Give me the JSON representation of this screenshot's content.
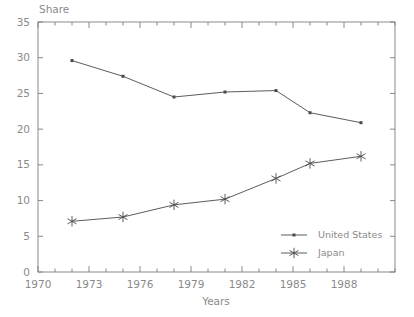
{
  "chart_data": {
    "type": "line",
    "title": "",
    "ylabel": "Share",
    "xlabel": "Years",
    "xlim": [
      1970,
      1991
    ],
    "ylim": [
      0,
      35
    ],
    "xticks": [
      1970,
      1973,
      1976,
      1979,
      1982,
      1985,
      1988
    ],
    "xtick_labels": [
      "1970",
      "1973",
      "1976",
      "1979",
      "1982",
      "1985",
      "1988"
    ],
    "xminor_step": 1,
    "yticks": [
      0,
      5,
      10,
      15,
      20,
      25,
      30,
      35
    ],
    "ytick_labels": [
      "0",
      "5",
      "10",
      "15",
      "20",
      "25",
      "30",
      "35"
    ],
    "grid": false,
    "legend_position": "inside-lower-right",
    "series": [
      {
        "name": "United States",
        "marker": "dot",
        "color": "#4a4a4a",
        "x": [
          1972,
          1975,
          1978,
          1981,
          1984,
          1986,
          1989
        ],
        "values": [
          29.6,
          27.4,
          24.5,
          25.2,
          25.4,
          22.3,
          20.9
        ]
      },
      {
        "name": "Japan",
        "marker": "asterisk",
        "color": "#4a4a4a",
        "x": [
          1972,
          1975,
          1978,
          1981,
          1984,
          1986,
          1989
        ],
        "values": [
          7.1,
          7.7,
          9.4,
          10.2,
          13.1,
          15.2,
          16.2
        ]
      }
    ]
  },
  "legend": {
    "items": [
      {
        "label": "United States"
      },
      {
        "label": "Japan"
      }
    ]
  },
  "axes": {
    "y_axis_label": "Share",
    "x_axis_label": "Years"
  }
}
